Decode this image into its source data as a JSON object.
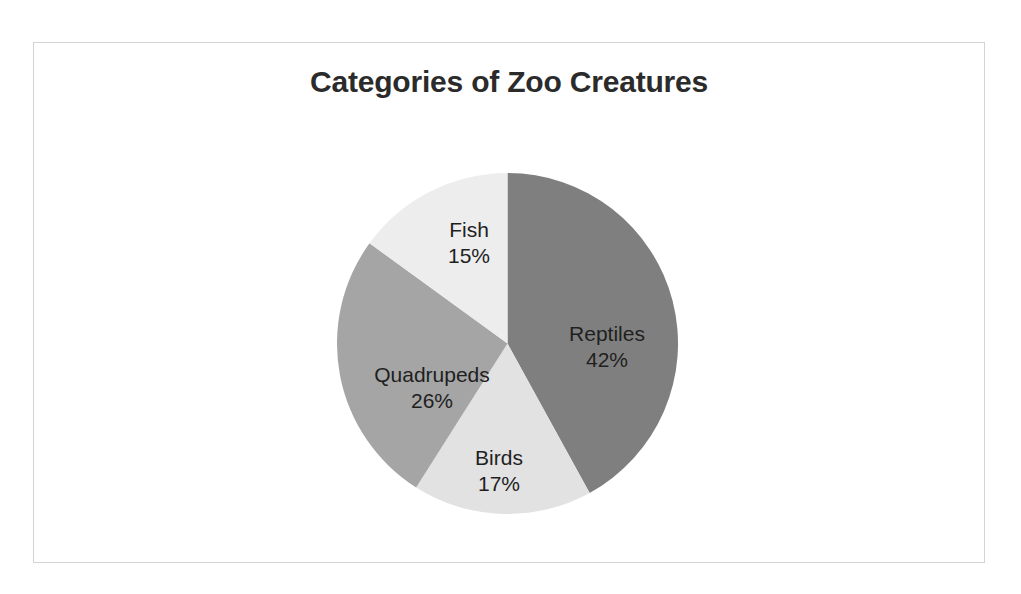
{
  "chart": {
    "title": "Categories of Zoo Creatures",
    "background": "#ffffff",
    "border_color": "#d4d4d4"
  },
  "chart_data": {
    "type": "pie",
    "title": "Categories of Zoo Creatures",
    "xlabel": "",
    "ylabel": "",
    "legend": "none",
    "grid": false,
    "start_angle_deg": 0,
    "direction": "clockwise",
    "labels_inside_slices": true,
    "label_format": "name + percent",
    "categories": [
      "Reptiles",
      "Birds",
      "Quadrupeds",
      "Fish"
    ],
    "values": [
      42,
      17,
      26,
      15
    ],
    "units": "percent",
    "colors": [
      "#7f7f7f",
      "#e2e2e2",
      "#a5a5a5",
      "#ededed"
    ],
    "slices": [
      {
        "name": "Reptiles",
        "value": 42,
        "percent_label": "42%",
        "color": "#7f7f7f",
        "start_deg": 0.0,
        "end_deg": 151.2
      },
      {
        "name": "Birds",
        "value": 17,
        "percent_label": "17%",
        "color": "#e2e2e2",
        "start_deg": 151.2,
        "end_deg": 212.4
      },
      {
        "name": "Quadrupeds",
        "value": 26,
        "percent_label": "26%",
        "color": "#a5a5a5",
        "start_deg": 212.4,
        "end_deg": 306.0
      },
      {
        "name": "Fish",
        "value": 15,
        "percent_label": "15%",
        "color": "#ededed",
        "start_deg": 306.0,
        "end_deg": 360.0
      }
    ]
  }
}
